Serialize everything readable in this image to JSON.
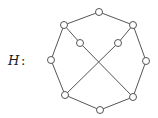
{
  "graph": {
    "label": "H",
    "separator": ":",
    "nodes": [
      {
        "id": "top",
        "x": 99,
        "y": 12
      },
      {
        "id": "upper-left",
        "x": 64,
        "y": 25
      },
      {
        "id": "upper-right",
        "x": 133,
        "y": 25
      },
      {
        "id": "inner-left",
        "x": 80,
        "y": 43
      },
      {
        "id": "inner-right",
        "x": 118,
        "y": 43
      },
      {
        "id": "left",
        "x": 51,
        "y": 60
      },
      {
        "id": "right",
        "x": 146,
        "y": 61
      },
      {
        "id": "lower-left",
        "x": 65,
        "y": 95
      },
      {
        "id": "lower-right",
        "x": 133,
        "y": 97
      },
      {
        "id": "bottom",
        "x": 100,
        "y": 110
      }
    ],
    "edges": [
      [
        "top",
        "upper-left"
      ],
      [
        "top",
        "upper-right"
      ],
      [
        "upper-left",
        "left"
      ],
      [
        "upper-left",
        "inner-left"
      ],
      [
        "inner-left",
        "lower-right"
      ],
      [
        "upper-right",
        "right"
      ],
      [
        "upper-right",
        "inner-right"
      ],
      [
        "inner-right",
        "lower-left"
      ],
      [
        "left",
        "lower-left"
      ],
      [
        "right",
        "lower-right"
      ],
      [
        "lower-left",
        "bottom"
      ],
      [
        "lower-right",
        "bottom"
      ]
    ],
    "node_radius": 3.5
  }
}
